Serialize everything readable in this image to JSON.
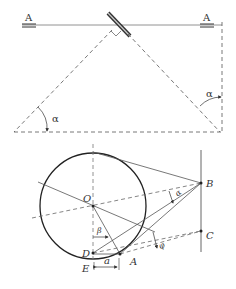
{
  "top_figure": {
    "labels": {
      "section_left": "A",
      "section_right": "A",
      "angle_left": "α",
      "angle_right": "α"
    }
  },
  "bottom_figure": {
    "labels": {
      "center": "O",
      "point_b": "B",
      "point_c": "C",
      "point_d": "D",
      "point_e": "E",
      "point_a": "A",
      "angle_alpha": "α",
      "angle_beta": "β",
      "angle_phi": "φ",
      "distance_a": "a"
    }
  },
  "colors": {
    "line": "#555555",
    "circle": "#222222",
    "mirror": "#333333"
  }
}
